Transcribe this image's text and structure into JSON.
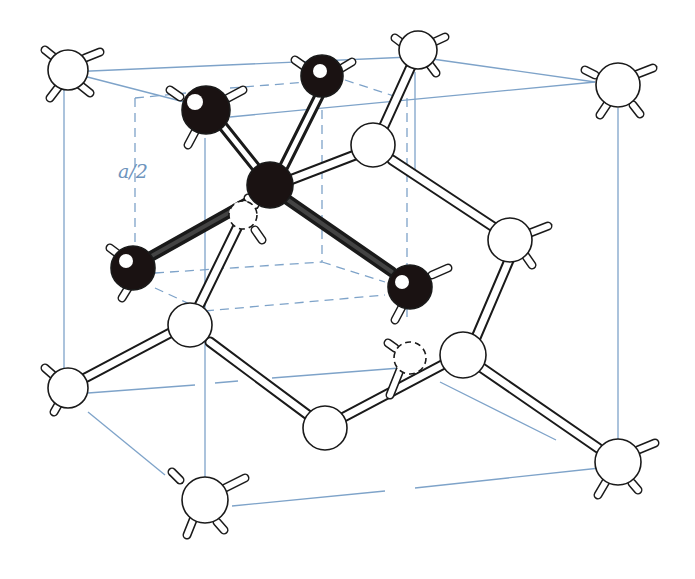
{
  "figure": {
    "dimension_label": "a/2",
    "colors": {
      "cell_edges": "#7ea3c9",
      "atom_highlighted": "#1a1212",
      "atom_regular": "#ffffff",
      "bonds": "#1a1a1a",
      "label": "#6e94bd"
    },
    "legend_notes": {
      "highlighted_group": "tetrahedral unit: central atom bonded to 4 neighbours (black)",
      "sub_cube": "dashed sub-cube of edge a/2"
    }
  }
}
